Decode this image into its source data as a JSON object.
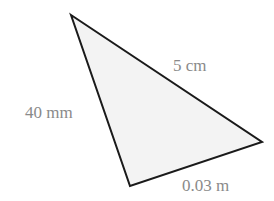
{
  "diagram": {
    "type": "triangle",
    "colors": {
      "fill": "#f3f3f3",
      "stroke": "#1a1a1a",
      "label": "#8a8a8a"
    },
    "vertices": {
      "top": [
        71,
        15
      ],
      "right": [
        262,
        142
      ],
      "bottom": [
        130,
        186
      ]
    },
    "sides": [
      {
        "id": "top-right",
        "label": "5 cm"
      },
      {
        "id": "top-bottom",
        "label": "40 mm"
      },
      {
        "id": "bottom-right",
        "label": "0.03 m"
      }
    ]
  }
}
